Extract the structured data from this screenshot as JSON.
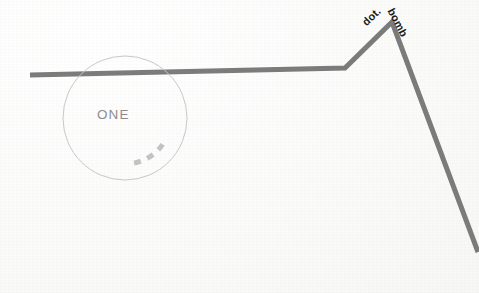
{
  "canvas": {
    "width": 479,
    "height": 293,
    "background_color": "#fdfdfc"
  },
  "annotations": {
    "circle_label": "ONE",
    "peak_label_left": "dot.",
    "peak_label_right": "bomb"
  },
  "colors": {
    "line": "#7c7c7c",
    "circle_stroke": "#c9c9c9",
    "dash_arc": "#c4c4c4",
    "one_text": "#8d8d8d",
    "peak_text": "#1d1d1d",
    "background": "#fdfdfc"
  },
  "chart_data": {
    "type": "line",
    "title": "",
    "subtitle": "",
    "xlabel": "",
    "ylabel": "",
    "grid": false,
    "legend": "none",
    "xlim": [
      0,
      479
    ],
    "ylim": [
      293,
      0
    ],
    "annotations": [
      {
        "text": "dot.",
        "x": 385,
        "y": 24,
        "rotation": -44,
        "bold": true
      },
      {
        "text": "bomb",
        "x": 398,
        "y": 24,
        "rotation": 62,
        "bold": true
      },
      {
        "text": "ONE",
        "x": 125,
        "y": 118,
        "rotation": 0,
        "bold": false
      }
    ],
    "series": [
      {
        "name": "market-line",
        "color": "#7c7c7c",
        "stroke_width": 5,
        "points": [
          {
            "x": 30,
            "y": 75
          },
          {
            "x": 345,
            "y": 68
          },
          {
            "x": 392,
            "y": 22
          },
          {
            "x": 478,
            "y": 252
          }
        ]
      }
    ],
    "overlays": [
      {
        "shape": "circle",
        "name": "highlight-circle",
        "cx": 125,
        "cy": 118,
        "r": 62,
        "stroke": "#c9c9c9",
        "stroke_width": 1,
        "fill": "none"
      },
      {
        "shape": "dashed-arc",
        "name": "dashed-arc",
        "cx": 125,
        "cy": 118,
        "r": 46,
        "start_angle_deg": 35,
        "end_angle_deg": 80,
        "stroke": "#c4c4c4",
        "stroke_width": 5,
        "dash_pattern": "7 7"
      }
    ]
  }
}
